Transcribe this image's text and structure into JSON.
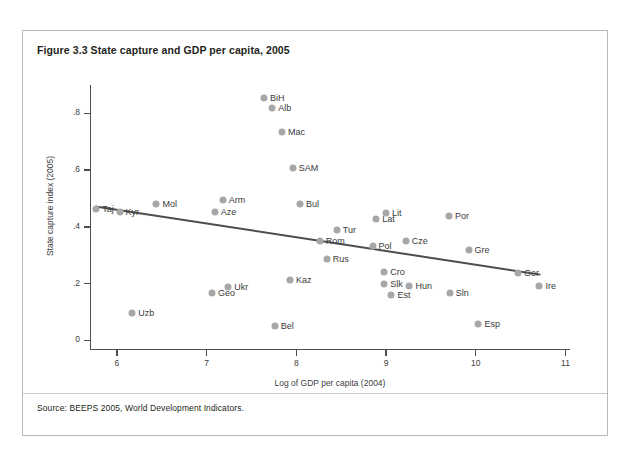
{
  "figure": {
    "title": "Figure 3.3  State capture and GDP per capita, 2005",
    "source": "Source: BEEPS 2005, World Development Indicators."
  },
  "chart_data": {
    "type": "scatter",
    "title": "State capture and GDP per capita, 2005",
    "xlabel": "Log of GDP per capita (2004)",
    "ylabel": "State capture index (2005)",
    "xlim": [
      5.7,
      11.05
    ],
    "ylim": [
      -0.03,
      0.9
    ],
    "xticks": [
      "6",
      "7",
      "8",
      "9",
      "10",
      "11"
    ],
    "xtick_values": [
      6,
      7,
      8,
      9,
      10,
      11
    ],
    "yticks": [
      "0",
      ".2",
      ".4",
      ".6",
      ".8"
    ],
    "ytick_values": [
      0,
      0.2,
      0.4,
      0.6,
      0.8
    ],
    "grid": false,
    "legend": "none",
    "trendline": {
      "label": "fitted regression line",
      "color": "#4d4d4d",
      "x_start": 5.76,
      "y_start": 0.472,
      "x_end": 10.72,
      "y_end": 0.232
    },
    "marker_color": "#a7a7a7",
    "points": [
      {
        "label": "BiH",
        "x": 7.64,
        "y": 0.854,
        "label_pos": "right"
      },
      {
        "label": "Alb",
        "x": 7.73,
        "y": 0.818,
        "label_pos": "right"
      },
      {
        "label": "Mac",
        "x": 7.84,
        "y": 0.736,
        "label_pos": "right"
      },
      {
        "label": "SAM",
        "x": 7.96,
        "y": 0.608,
        "label_pos": "right"
      },
      {
        "label": "Bul",
        "x": 8.04,
        "y": 0.48,
        "label_pos": "right"
      },
      {
        "label": "Arm",
        "x": 7.18,
        "y": 0.496,
        "label_pos": "right"
      },
      {
        "label": "Aze",
        "x": 7.09,
        "y": 0.452,
        "label_pos": "right"
      },
      {
        "label": "Mol",
        "x": 6.44,
        "y": 0.48,
        "label_pos": "right"
      },
      {
        "label": "Taj",
        "x": 5.77,
        "y": 0.462,
        "label_pos": "right"
      },
      {
        "label": "Kyr",
        "x": 6.03,
        "y": 0.452,
        "label_pos": "right"
      },
      {
        "label": "Lit",
        "x": 9.0,
        "y": 0.448,
        "label_pos": "right"
      },
      {
        "label": "Lat",
        "x": 8.89,
        "y": 0.427,
        "label_pos": "right"
      },
      {
        "label": "Tur",
        "x": 8.45,
        "y": 0.39,
        "label_pos": "right"
      },
      {
        "label": "Rom",
        "x": 8.26,
        "y": 0.352,
        "label_pos": "right"
      },
      {
        "label": "Pol",
        "x": 8.85,
        "y": 0.332,
        "label_pos": "right"
      },
      {
        "label": "Rus",
        "x": 8.34,
        "y": 0.288,
        "label_pos": "right"
      },
      {
        "label": "Cze",
        "x": 9.22,
        "y": 0.352,
        "label_pos": "right"
      },
      {
        "label": "Por",
        "x": 9.7,
        "y": 0.44,
        "label_pos": "right"
      },
      {
        "label": "Gre",
        "x": 9.92,
        "y": 0.32,
        "label_pos": "right"
      },
      {
        "label": "Ger",
        "x": 10.47,
        "y": 0.238,
        "label_pos": "right"
      },
      {
        "label": "Ire",
        "x": 10.71,
        "y": 0.192,
        "label_pos": "right"
      },
      {
        "label": "Cro",
        "x": 8.98,
        "y": 0.24,
        "label_pos": "right"
      },
      {
        "label": "Slk",
        "x": 8.98,
        "y": 0.2,
        "label_pos": "right"
      },
      {
        "label": "Hun",
        "x": 9.26,
        "y": 0.192,
        "label_pos": "right"
      },
      {
        "label": "Est",
        "x": 9.06,
        "y": 0.16,
        "label_pos": "right"
      },
      {
        "label": "Sln",
        "x": 9.71,
        "y": 0.168,
        "label_pos": "right"
      },
      {
        "label": "Kaz",
        "x": 7.93,
        "y": 0.213,
        "label_pos": "right"
      },
      {
        "label": "Ukr",
        "x": 7.24,
        "y": 0.19,
        "label_pos": "right"
      },
      {
        "label": "Geo",
        "x": 7.06,
        "y": 0.168,
        "label_pos": "right"
      },
      {
        "label": "Uzb",
        "x": 6.17,
        "y": 0.096,
        "label_pos": "right"
      },
      {
        "label": "Bel",
        "x": 7.76,
        "y": 0.05,
        "label_pos": "right"
      },
      {
        "label": "Esp",
        "x": 10.03,
        "y": 0.057,
        "label_pos": "right"
      }
    ]
  }
}
